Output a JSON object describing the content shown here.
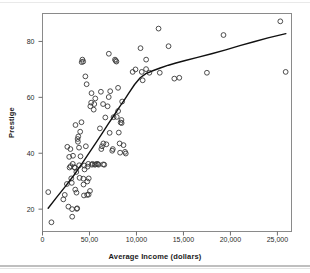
{
  "figure": {
    "background_color": "#ffffff",
    "frame_color": "#8a8a8a",
    "marker_color": "#3a3a3a",
    "curve_color": "#111111"
  },
  "chart_data": {
    "type": "scatter",
    "title": "",
    "xlabel": "Average Income (dollars)",
    "ylabel": "Prestige",
    "xlim": [
      0,
      26500
    ],
    "ylim": [
      12,
      90
    ],
    "grid": false,
    "legend": null,
    "xticks": [
      0,
      5000,
      10000,
      15000,
      20000,
      25000
    ],
    "xticklabels": [
      "0",
      "50,00",
      "10,000",
      "15,000",
      "20,000",
      "25,000"
    ],
    "yticks": [
      20,
      40,
      60,
      80
    ],
    "yticklabels": [
      "20",
      "40",
      "60",
      "80"
    ],
    "marker": "open-circle",
    "points": [
      [
        611,
        26.1
      ],
      [
        950,
        15.3
      ],
      [
        2216,
        23.5
      ],
      [
        2370,
        25.1
      ],
      [
        2594,
        29.0
      ],
      [
        2642,
        42.3
      ],
      [
        2755,
        20.9
      ],
      [
        2843,
        38.7
      ],
      [
        2880,
        34.9
      ],
      [
        2970,
        41.5
      ],
      [
        3000,
        35.4
      ],
      [
        3060,
        31.0
      ],
      [
        3116,
        29.4
      ],
      [
        3148,
        20.0
      ],
      [
        3161,
        17.3
      ],
      [
        3221,
        36.2
      ],
      [
        3247,
        39.1
      ],
      [
        3399,
        35.0
      ],
      [
        3446,
        34.8
      ],
      [
        3485,
        27.0
      ],
      [
        3511,
        50.1
      ],
      [
        3600,
        33.3
      ],
      [
        3617,
        25.9
      ],
      [
        3650,
        20.1
      ],
      [
        3691,
        20.3
      ],
      [
        3734,
        45.1
      ],
      [
        3770,
        44.1
      ],
      [
        3807,
        46.0
      ],
      [
        3886,
        42.0
      ],
      [
        3906,
        35.7
      ],
      [
        3946,
        31.2
      ],
      [
        4011,
        47.7
      ],
      [
        4045,
        38.9
      ],
      [
        4147,
        51.1
      ],
      [
        4168,
        72.6
      ],
      [
        4250,
        73.5
      ],
      [
        4330,
        72.8
      ],
      [
        4349,
        30.9
      ],
      [
        4364,
        28.8
      ],
      [
        4411,
        24.9
      ],
      [
        4444,
        35.6
      ],
      [
        4472,
        34.2
      ],
      [
        4563,
        67.5
      ],
      [
        4614,
        42.5
      ],
      [
        4696,
        64.7
      ],
      [
        4751,
        25.1
      ],
      [
        4767,
        29.9
      ],
      [
        4800,
        35.2
      ],
      [
        4870,
        36.2
      ],
      [
        4906,
        25.2
      ],
      [
        4921,
        31.0
      ],
      [
        5052,
        26.5
      ],
      [
        5092,
        56.8
      ],
      [
        5180,
        58.1
      ],
      [
        5216,
        61.5
      ],
      [
        5261,
        35.9
      ],
      [
        5310,
        36.2
      ],
      [
        5449,
        55.6
      ],
      [
        5511,
        57.6
      ],
      [
        5555,
        35.9
      ],
      [
        5618,
        59.6
      ],
      [
        5659,
        36.0
      ],
      [
        5795,
        36.2
      ],
      [
        5902,
        36.1
      ],
      [
        5959,
        35.9
      ],
      [
        6112,
        48.9
      ],
      [
        6214,
        62.0
      ],
      [
        6258,
        41.5
      ],
      [
        6336,
        42.5
      ],
      [
        6447,
        57.6
      ],
      [
        6462,
        36.0
      ],
      [
        6477,
        43.5
      ],
      [
        6573,
        35.9
      ],
      [
        6686,
        52.8
      ],
      [
        6797,
        43.2
      ],
      [
        6928,
        56.8
      ],
      [
        7048,
        60.1
      ],
      [
        7059,
        75.6
      ],
      [
        7147,
        47.3
      ],
      [
        7204,
        62.2
      ],
      [
        7420,
        40.9
      ],
      [
        7482,
        41.5
      ],
      [
        7562,
        52.9
      ],
      [
        7716,
        73.5
      ],
      [
        7784,
        73.1
      ],
      [
        7869,
        72.8
      ],
      [
        7904,
        53.0
      ],
      [
        8043,
        63.4
      ],
      [
        8049,
        55.1
      ],
      [
        8118,
        47.4
      ],
      [
        8206,
        43.5
      ],
      [
        8258,
        40.2
      ],
      [
        8316,
        51.0
      ],
      [
        8403,
        51.9
      ],
      [
        8425,
        50.8
      ],
      [
        8478,
        58.5
      ],
      [
        8621,
        42.9
      ],
      [
        8780,
        40.5
      ],
      [
        8865,
        39.9
      ],
      [
        9593,
        69.1
      ],
      [
        9896,
        70.0
      ],
      [
        10432,
        77.6
      ],
      [
        10561,
        69.1
      ],
      [
        10660,
        66.1
      ],
      [
        11030,
        73.5
      ],
      [
        11023,
        70.1
      ],
      [
        11377,
        68.8
      ],
      [
        12351,
        84.6
      ],
      [
        12480,
        68.8
      ],
      [
        13415,
        78.3
      ],
      [
        14030,
        66.7
      ],
      [
        14558,
        67.0
      ],
      [
        17498,
        68.8
      ],
      [
        19263,
        82.3
      ],
      [
        25308,
        87.2
      ],
      [
        25879,
        69.1
      ]
    ],
    "fit_curve": {
      "type": "lowess",
      "label": "smoothed fit line",
      "points": [
        [
          600,
          20.3
        ],
        [
          1500,
          24.2
        ],
        [
          2500,
          28.4
        ],
        [
          3400,
          32.4
        ],
        [
          4200,
          36.3
        ],
        [
          5000,
          40.3
        ],
        [
          5700,
          43.8
        ],
        [
          6400,
          47.4
        ],
        [
          7000,
          50.5
        ],
        [
          7600,
          53.5
        ],
        [
          8200,
          56.6
        ],
        [
          8700,
          59.0
        ],
        [
          9200,
          61.6
        ],
        [
          9800,
          64.6
        ],
        [
          10400,
          67.0
        ],
        [
          11000,
          68.5
        ],
        [
          11800,
          69.6
        ],
        [
          12600,
          70.6
        ],
        [
          13400,
          71.5
        ],
        [
          14200,
          72.3
        ],
        [
          15200,
          73.2
        ],
        [
          16500,
          74.3
        ],
        [
          18000,
          75.6
        ],
        [
          19500,
          77.0
        ],
        [
          21000,
          78.5
        ],
        [
          22500,
          79.9
        ],
        [
          24000,
          81.3
        ],
        [
          25900,
          82.8
        ]
      ]
    }
  }
}
